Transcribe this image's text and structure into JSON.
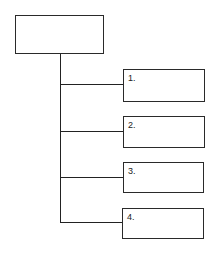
{
  "diagram": {
    "type": "tree",
    "root": {
      "label": ""
    },
    "children": [
      {
        "label": "1."
      },
      {
        "label": "2."
      },
      {
        "label": "3."
      },
      {
        "label": "4."
      }
    ],
    "colors": {
      "stroke": "#222222",
      "background": "#ffffff"
    }
  }
}
